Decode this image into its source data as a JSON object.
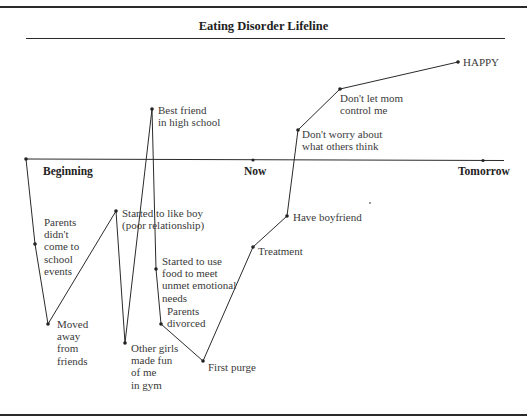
{
  "figure": {
    "title": "Eating Disorder Lifeline",
    "timeline_labels": {
      "start": "Beginning",
      "middle": "Now",
      "end": "Tomorrow"
    },
    "events": [
      {
        "id": "start",
        "label": "",
        "x": 26,
        "y": 159
      },
      {
        "id": "parents-absent",
        "label": "Parents\ndidn't\ncome to\nschool\nevents",
        "x": 35,
        "y": 244
      },
      {
        "id": "moved-away",
        "label": "Moved\naway\nfrom\nfriends",
        "x": 48,
        "y": 324
      },
      {
        "id": "liked-boy",
        "label": "Started to like boy\n(poor relationship)",
        "x": 116,
        "y": 211
      },
      {
        "id": "girls-made-fun",
        "label": "Other girls\nmade fun\nof me\nin gym",
        "x": 125,
        "y": 343
      },
      {
        "id": "best-friend",
        "label": "Best friend\nin high school",
        "x": 152,
        "y": 109
      },
      {
        "id": "food-emotional",
        "label": "Started to use\nfood to meet\nunmet emotional\nneeds",
        "x": 156,
        "y": 269
      },
      {
        "id": "parents-divorced",
        "label": "Parents\ndivorced",
        "x": 161,
        "y": 324
      },
      {
        "id": "first-purge",
        "label": "First purge",
        "x": 203,
        "y": 361
      },
      {
        "id": "treatment",
        "label": "Treatment",
        "x": 253,
        "y": 247
      },
      {
        "id": "boyfriend",
        "label": "Have boyfriend",
        "x": 287,
        "y": 216
      },
      {
        "id": "dont-worry",
        "label": "Don't worry about\nwhat others think",
        "x": 298,
        "y": 130
      },
      {
        "id": "mom-control",
        "label": "Don't let mom\ncontrol me",
        "x": 340,
        "y": 89
      },
      {
        "id": "happy",
        "label": "HAPPY",
        "x": 458,
        "y": 62
      }
    ],
    "axis": {
      "y": 159,
      "x_start": 26,
      "x_end": 504,
      "now_x": 253,
      "tomorrow_x": 483
    },
    "colors": {
      "line": "#2a2a2a",
      "text": "#3a3a3a",
      "background": "#ffffff"
    }
  }
}
